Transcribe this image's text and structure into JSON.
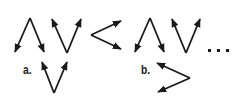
{
  "puzzle": {
    "sequence": [
      {
        "shape": "caret-up",
        "arrows": "down",
        "description": "Λ with arrowheads pointing down"
      },
      {
        "shape": "caret-down",
        "arrows": "up",
        "description": "V with arrowheads pointing up"
      },
      {
        "shape": "less-than",
        "arrows": "right",
        "description": "< with arrowheads pointing right"
      },
      {
        "shape": "caret-up",
        "arrows": "down",
        "description": "Λ with arrowheads pointing down"
      },
      {
        "shape": "caret-down",
        "arrows": "up",
        "description": "V with arrowheads pointing up"
      }
    ],
    "ellipsis": "...",
    "options": [
      {
        "label": "a.",
        "shape": "caret-down",
        "arrows": "up"
      },
      {
        "label": "b.",
        "shape": "greater-than",
        "arrows": "left"
      }
    ]
  },
  "colors": {
    "stroke": "#1a1a1a",
    "background": "#ffffff"
  }
}
